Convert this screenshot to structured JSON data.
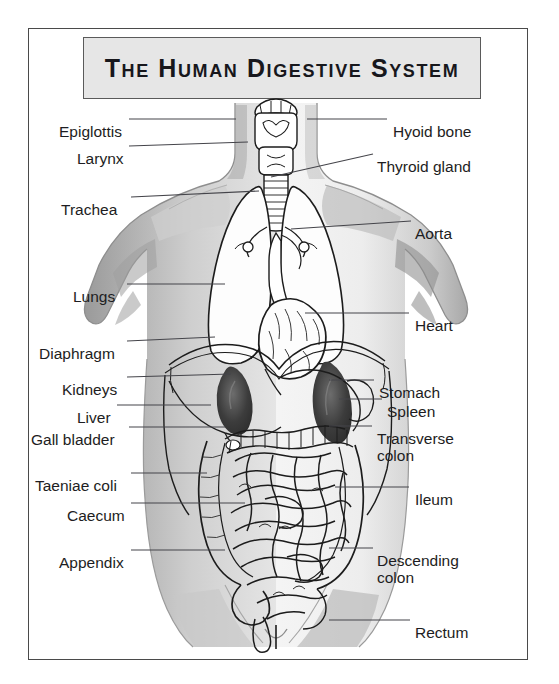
{
  "figure": {
    "title": "The Human Digestive System",
    "frame_color": "#4a4a4a",
    "title_box_fill": "#e6e6e6",
    "title_text_color": "#17171c",
    "artwork_style": "grayscale anatomical line drawing of male torso, front view"
  },
  "labels_left": [
    {
      "name": "epiglottis",
      "text": "Epiglottis",
      "text_x": 30,
      "text_y": 94,
      "line_x1": 100,
      "line_y1": 90,
      "line_x2": 207,
      "line_y2": 90
    },
    {
      "name": "larynx",
      "text": "Larynx",
      "text_x": 48,
      "text_y": 121,
      "line_x1": 100,
      "line_y1": 117,
      "line_x2": 219,
      "line_y2": 113
    },
    {
      "name": "trachea",
      "text": "Trachea",
      "text_x": 32,
      "text_y": 172,
      "line_x1": 102,
      "line_y1": 168,
      "line_x2": 230,
      "line_y2": 162
    },
    {
      "name": "lungs",
      "text": "Lungs",
      "text_x": 44,
      "text_y": 259,
      "line_x1": 98,
      "line_y1": 255,
      "line_x2": 196,
      "line_y2": 255
    },
    {
      "name": "diaphragm",
      "text": "Diaphragm",
      "text_x": 10,
      "text_y": 316,
      "line_x1": 98,
      "line_y1": 312,
      "line_x2": 186,
      "line_y2": 308
    },
    {
      "name": "kidneys",
      "text": "Kidneys",
      "text_x": 33,
      "text_y": 352,
      "line_x1": 98,
      "line_y1": 348,
      "line_x2": 202,
      "line_y2": 345
    },
    {
      "name": "liver",
      "text": "Liver",
      "text_x": 48,
      "text_y": 380,
      "line_x1": 88,
      "line_y1": 376,
      "line_x2": 182,
      "line_y2": 376
    },
    {
      "name": "gall-bladder",
      "text": "Gall bladder",
      "text_x": 2,
      "text_y": 402,
      "line_x1": 100,
      "line_y1": 398,
      "line_x2": 196,
      "line_y2": 398
    },
    {
      "name": "taeniae-coli",
      "text": "Taeniae coli",
      "text_x": 6,
      "text_y": 448,
      "line_x1": 102,
      "line_y1": 444,
      "line_x2": 178,
      "line_y2": 444
    },
    {
      "name": "caecum",
      "text": "Caecum",
      "text_x": 38,
      "text_y": 478,
      "line_x1": 102,
      "line_y1": 474,
      "line_x2": 216,
      "line_y2": 474
    },
    {
      "name": "appendix",
      "text": "Appendix",
      "text_x": 30,
      "text_y": 525,
      "line_x1": 102,
      "line_y1": 521,
      "line_x2": 196,
      "line_y2": 521
    }
  ],
  "labels_right": [
    {
      "name": "hyoid-bone",
      "text": "Hyoid bone",
      "text_x": 364,
      "text_y": 94,
      "line_x1": 278,
      "line_y1": 90,
      "line_x2": 358,
      "line_y2": 90
    },
    {
      "name": "thyroid-gland",
      "text": "Thyroid gland",
      "text_x": 348,
      "text_y": 129,
      "line_x1": 242,
      "line_y1": 148,
      "line_x2": 344,
      "line_y2": 125
    },
    {
      "name": "aorta",
      "text": "Aorta",
      "text_x": 386,
      "text_y": 196,
      "line_x1": 262,
      "line_y1": 200,
      "line_x2": 382,
      "line_y2": 192
    },
    {
      "name": "heart",
      "text": "Heart",
      "text_x": 386,
      "text_y": 288,
      "line_x1": 276,
      "line_y1": 284,
      "line_x2": 380,
      "line_y2": 284
    },
    {
      "name": "stomach",
      "text": "Stomach",
      "text_x": 350,
      "text_y": 355,
      "line_x1": 300,
      "line_y1": 351,
      "line_x2": 345,
      "line_y2": 351
    },
    {
      "name": "spleen",
      "text": "Spleen",
      "text_x": 358,
      "text_y": 374,
      "line_x1": 310,
      "line_y1": 370,
      "line_x2": 353,
      "line_y2": 370
    },
    {
      "name": "transverse-colon",
      "text": "Transverse\ncolon",
      "text_x": 348,
      "text_y": 401,
      "line_x1": 300,
      "line_y1": 397,
      "line_x2": 343,
      "line_y2": 397
    },
    {
      "name": "ileum",
      "text": "Ileum",
      "text_x": 386,
      "text_y": 462,
      "line_x1": 306,
      "line_y1": 458,
      "line_x2": 380,
      "line_y2": 458
    },
    {
      "name": "descending-colon",
      "text": "Descending\ncolon",
      "text_x": 348,
      "text_y": 523,
      "line_x1": 300,
      "line_y1": 519,
      "line_x2": 344,
      "line_y2": 519
    },
    {
      "name": "rectum",
      "text": "Rectum",
      "text_x": 386,
      "text_y": 595,
      "line_x1": 300,
      "line_y1": 591,
      "line_x2": 381,
      "line_y2": 591
    }
  ]
}
